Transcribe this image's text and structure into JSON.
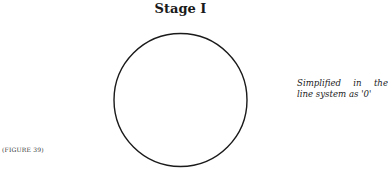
{
  "title": "Stage I",
  "caption": {
    "line1_words": [
      "Simplified",
      "in",
      "the"
    ],
    "line2": "line system as '0'"
  },
  "figure_label": "(FIGURE 39)",
  "shape": {
    "type": "circle",
    "cx": 180.5,
    "cy": 100,
    "r": 66.5,
    "stroke": "#1a1a1a"
  }
}
